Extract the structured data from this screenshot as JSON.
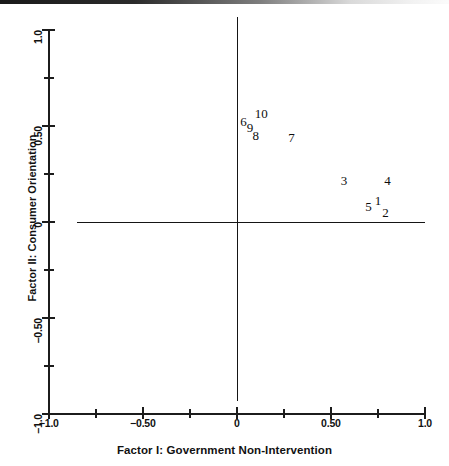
{
  "chart_data": {
    "type": "scatter",
    "title": "",
    "xlabel": "Factor I: Government Non-Intervention",
    "ylabel": "Factor II: Consumer Orientation",
    "xlim": [
      -1.0,
      1.0
    ],
    "ylim": [
      -1.0,
      1.0
    ],
    "grid": false,
    "legend": null,
    "marker_style": "numeric-label",
    "x_ticks": [
      {
        "value": -1.0,
        "label": "−1.0",
        "major": true
      },
      {
        "value": -0.75,
        "label": "",
        "major": false
      },
      {
        "value": -0.5,
        "label": "−0.50",
        "major": true
      },
      {
        "value": -0.25,
        "label": "",
        "major": false
      },
      {
        "value": 0.0,
        "label": "0",
        "major": true
      },
      {
        "value": 0.25,
        "label": "",
        "major": false
      },
      {
        "value": 0.5,
        "label": "0.50",
        "major": true
      },
      {
        "value": 0.75,
        "label": "",
        "major": false
      },
      {
        "value": 1.0,
        "label": "1.0",
        "major": true
      }
    ],
    "y_ticks": [
      {
        "value": 1.0,
        "label": "1.0",
        "major": true
      },
      {
        "value": 0.75,
        "label": "",
        "major": false
      },
      {
        "value": 0.5,
        "label": "0.50",
        "major": true
      },
      {
        "value": 0.25,
        "label": "",
        "major": false
      },
      {
        "value": 0.0,
        "label": "0",
        "major": true
      },
      {
        "value": -0.25,
        "label": "",
        "major": false
      },
      {
        "value": -0.5,
        "label": "−0.50",
        "major": true
      },
      {
        "value": -0.75,
        "label": "",
        "major": false
      },
      {
        "value": -1.0,
        "label": "−1.0",
        "major": true
      }
    ],
    "points": [
      {
        "label": "6",
        "x": 0.035,
        "y": 0.525
      },
      {
        "label": "10",
        "x": 0.13,
        "y": 0.565
      },
      {
        "label": "9",
        "x": 0.07,
        "y": 0.495
      },
      {
        "label": "8",
        "x": 0.1,
        "y": 0.45
      },
      {
        "label": "7",
        "x": 0.29,
        "y": 0.44
      },
      {
        "label": "3",
        "x": 0.57,
        "y": 0.22
      },
      {
        "label": "4",
        "x": 0.8,
        "y": 0.22
      },
      {
        "label": "1",
        "x": 0.75,
        "y": 0.115
      },
      {
        "label": "5",
        "x": 0.7,
        "y": 0.08
      },
      {
        "label": "2",
        "x": 0.79,
        "y": 0.05
      }
    ],
    "reference_lines": [
      {
        "axis": "vertical",
        "value": 0.0
      },
      {
        "axis": "horizontal",
        "value": 0.0
      }
    ]
  }
}
